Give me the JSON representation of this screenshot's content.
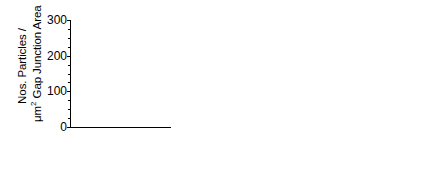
{
  "figure": {
    "ylabel_line1": "Nos. Particles /",
    "ylabel_line2_a": "μm",
    "ylabel_line2_sup": "2",
    "ylabel_line2_b": " Gap Junction Area",
    "y_ticks": [
      "0",
      "100",
      "200",
      "300"
    ],
    "y_tick_values": [
      0,
      100,
      200,
      300
    ],
    "ylim": [
      0,
      300
    ]
  },
  "panels": [
    {
      "id": "a",
      "badge": "a",
      "xlabel_main": "E",
      "xlabel_sub": "2",
      "xlabel_rest": "(ng/foll)",
      "xlabel_full": "E2 (ng/foll)",
      "x_ticks": [
        ".01",
        ".1",
        "1",
        "5"
      ],
      "x_tick_values": [
        0.01,
        0.1,
        1,
        5
      ],
      "show_y_numbers": true
    },
    {
      "id": "b",
      "badge": "b",
      "xlabel_main": "T",
      "xlabel_sub": "",
      "xlabel_rest": "(ng/foll)",
      "xlabel_full": "T (ng/foll)",
      "x_ticks": [
        ".01",
        ".1",
        "1"
      ],
      "x_tick_values": [
        0.01,
        0.1,
        1
      ],
      "show_y_numbers": false
    },
    {
      "id": "c",
      "badge": "c",
      "xlabel_main": "P",
      "xlabel_sub": "4",
      "xlabel_rest": "(ng/foll)",
      "xlabel_full": "P4 (ng/foll)",
      "x_ticks": [
        ".01",
        ".1",
        "1",
        "10",
        "100"
      ],
      "x_tick_values": [
        0.01,
        0.1,
        1,
        10,
        100
      ],
      "show_y_numbers": false
    }
  ],
  "chart_data": [
    {
      "type": "scatter",
      "panel": "a",
      "title": "",
      "xlabel": "E2 (ng/foll)",
      "ylabel": "Nos. Particles / μm2 Gap Junction Area",
      "xscale": "log",
      "xlim": [
        0.01,
        5
      ],
      "ylim": [
        0,
        300
      ],
      "grid": false,
      "marker": "triangle",
      "points": [
        {
          "x": 0.032,
          "y": 240,
          "yerr": 0
        },
        {
          "x": 0.032,
          "y": 115,
          "yerr": 20
        },
        {
          "x": 0.16,
          "y": 202,
          "yerr": 30
        },
        {
          "x": 0.2,
          "y": 153,
          "yerr": 0
        },
        {
          "x": 0.85,
          "y": 210,
          "yerr": 28
        }
      ],
      "fit_line": {
        "x1": 0.01,
        "y1": 181,
        "x2": 5,
        "y2": 183,
        "note": "flat regression"
      }
    },
    {
      "type": "scatter",
      "panel": "b",
      "title": "",
      "xlabel": "T (ng/foll)",
      "ylabel": "Nos. Particles / μm2 Gap Junction Area",
      "xscale": "log",
      "xlim": [
        0.01,
        1
      ],
      "ylim": [
        0,
        300
      ],
      "grid": false,
      "marker": "circle",
      "points": [
        {
          "x": 0.028,
          "y": 232,
          "yerr": 0
        },
        {
          "x": 0.028,
          "y": 118,
          "yerr": 22
        },
        {
          "x": 0.105,
          "y": 205,
          "yerr": 28
        },
        {
          "x": 0.12,
          "y": 176,
          "yerr": 20
        },
        {
          "x": 0.22,
          "y": 163,
          "yerr": 0
        },
        {
          "x": 0.42,
          "y": 200,
          "yerr": 25
        }
      ],
      "fit_line": {
        "x1": 0.01,
        "y1": 176,
        "x2": 1,
        "y2": 195,
        "note": "slight positive slope"
      }
    },
    {
      "type": "scatter",
      "panel": "c",
      "title": "",
      "xlabel": "P4 (ng/foll)",
      "ylabel": "Nos. Particles / μm2 Gap Junction Area",
      "xscale": "log",
      "xlim": [
        0.01,
        100
      ],
      "ylim": [
        0,
        300
      ],
      "grid": false,
      "marker": "diamond",
      "points": [
        {
          "x": 0.04,
          "y": 232,
          "yerr": 0
        },
        {
          "x": 0.22,
          "y": 205,
          "yerr": 33
        },
        {
          "x": 1.0,
          "y": 212,
          "yerr": 25
        },
        {
          "x": 1.6,
          "y": 172,
          "yerr": 0
        },
        {
          "x": 6.5,
          "y": 180,
          "yerr": 15
        },
        {
          "x": 20,
          "y": 143,
          "yerr": 22
        }
      ],
      "fit_line": {
        "x1": 0.01,
        "y1": 240,
        "x2": 100,
        "y2": 133,
        "note": "negative slope"
      }
    }
  ]
}
